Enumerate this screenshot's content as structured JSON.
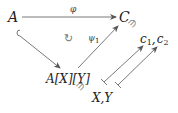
{
  "diagram": {
    "nodes": {
      "A": "A",
      "C": "C",
      "AXY": "A[X][Y]",
      "XY": "X,Y",
      "c1c2": "c1,c2"
    },
    "labels": {
      "phi": "φ",
      "psi1": "ψ1",
      "commutes": "↻",
      "ni": "∋"
    },
    "edges": [
      {
        "from": "A",
        "to": "C",
        "label": "φ",
        "style": "arrow"
      },
      {
        "from": "A",
        "to": "A[X][Y]",
        "label": "",
        "style": "hook-arrow"
      },
      {
        "from": "A[X][Y]",
        "to": "C",
        "label": "ψ1",
        "style": "arrow"
      },
      {
        "from": "X",
        "to": "c1",
        "label": "",
        "style": "maps-to"
      },
      {
        "from": "Y",
        "to": "c2",
        "label": "",
        "style": "maps-to"
      }
    ],
    "colors": {
      "text": "#222222",
      "arrow": "#555555",
      "symbol": "#777777"
    }
  }
}
